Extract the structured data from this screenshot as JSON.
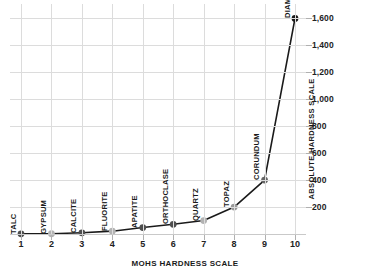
{
  "chart_data": {
    "type": "line",
    "title": "",
    "subtitle": "",
    "xlabel": "MOHS HARDNESS SCALE",
    "ylabel": "ABSOLUTE HARDNESS SCALE",
    "x": [
      1,
      2,
      3,
      4,
      5,
      6,
      7,
      8,
      9,
      10
    ],
    "values": [
      1,
      2,
      9,
      21,
      48,
      72,
      100,
      200,
      400,
      1600
    ],
    "point_labels": [
      "TALC",
      "GYPSUM",
      "CALCITE",
      "FLUORITE",
      "APATITE",
      "ORTHOCLASE",
      "QUARTZ",
      "TOPAZ",
      "CORUNDUM",
      "DIAMOND"
    ],
    "xtick_labels": [
      "1",
      "2",
      "3",
      "4",
      "5",
      "6",
      "7",
      "8",
      "9",
      "10"
    ],
    "ytick_labels": [
      "200",
      "400",
      "600",
      "800",
      "1,000",
      "1,200",
      "1,400",
      "1,600"
    ],
    "ytick_values": [
      200,
      400,
      600,
      800,
      1000,
      1200,
      1400,
      1600
    ],
    "xlim": [
      1,
      10
    ],
    "ylim": [
      0,
      1700
    ],
    "grid": true,
    "legend": "none",
    "y_axis_position": "right",
    "line_color": "#1a1a1a",
    "marker_colors": [
      "#4d4d4d",
      "#b3b3b3",
      "#4d4d4d",
      "#b3b3b3",
      "#4d4d4d",
      "#4d4d4d",
      "#b3b3b3",
      "#999999",
      "#666666",
      "#1a1a1a"
    ],
    "grid_color": "#dcdcdc",
    "background_color": "#ffffff",
    "text_color": "#1a1a1a"
  }
}
